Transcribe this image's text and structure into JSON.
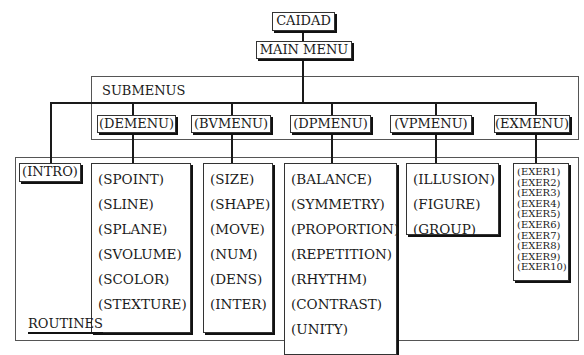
{
  "top": {
    "title": "CAIDAD",
    "main_menu": "MAIN MENU"
  },
  "submenus": {
    "label": "SUBMENUS",
    "items": [
      "(DEMENU)",
      "(BVMENU)",
      "(DPMENU)",
      "(VPMENU)",
      "(EXMENU)"
    ]
  },
  "routines": {
    "label": "ROUTINES",
    "intro": "(INTRO)",
    "groups": [
      {
        "parent": "(DEMENU)",
        "items": [
          "(SPOINT)",
          "(SLINE)",
          "(SPLANE)",
          "(SVOLUME)",
          "(SCOLOR)",
          "(STEXTURE)"
        ]
      },
      {
        "parent": "(BVMENU)",
        "items": [
          "(SIZE)",
          "(SHAPE)",
          "(MOVE)",
          "(NUM)",
          "(DENS)",
          "(INTER)"
        ]
      },
      {
        "parent": "(DPMENU)",
        "items": [
          "(BALANCE)",
          "(SYMMETRY)",
          "(PROPORTION)",
          "(REPETITION)",
          "(RHYTHM)",
          "(CONTRAST)",
          "(UNITY)"
        ]
      },
      {
        "parent": "(VPMENU)",
        "items": [
          "(ILLUSION)",
          "(FIGURE)",
          "(GROUP)"
        ]
      },
      {
        "parent": "(EXMENU)",
        "items": [
          "(EXER1)",
          "(EXER2)",
          "(EXER3)",
          "(EXER4)",
          "(EXER5)",
          "(EXER6)",
          "(EXER7)",
          "(EXER8)",
          "(EXER9)",
          "(EXER10)"
        ]
      }
    ]
  }
}
